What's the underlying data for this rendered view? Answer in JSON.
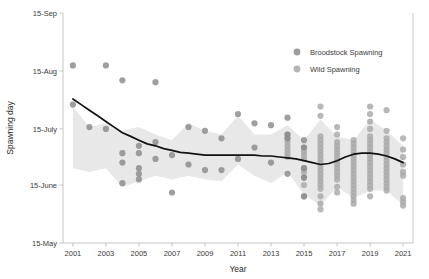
{
  "chart_data": {
    "type": "scatter",
    "title": "",
    "xlabel": "Year",
    "ylabel": "Spawning day",
    "xlim": [
      2000.4,
      2021.6
    ],
    "ylim": [
      0,
      123
    ],
    "grid": false,
    "legend_position": "top-right",
    "x_ticks": [
      2001,
      2003,
      2005,
      2007,
      2009,
      2011,
      2013,
      2015,
      2017,
      2019,
      2021
    ],
    "x_tick_labels": [
      "2001",
      "2003",
      "2005",
      "2007",
      "2009",
      "2011",
      "2013",
      "2015",
      "2017",
      "2019",
      "2021"
    ],
    "y_ticks": [
      0,
      31,
      61,
      92,
      123
    ],
    "y_tick_labels": [
      "15-May",
      "15-June",
      "15-July",
      "15-Aug",
      "15-Sep"
    ],
    "colors": {
      "broodstock": "#8a8a8a",
      "wild": "#a8a8a8",
      "trend_line": "#111111",
      "confidence_band": "#e8e8e8",
      "axis": "#b8b8b8",
      "text": "#3a3a3a"
    },
    "legend": [
      {
        "key": "broodstock",
        "label": "Broodstock Spawning",
        "color": "#8a8a8a"
      },
      {
        "key": "wild",
        "label": "Wild Spawning",
        "color": "#a8a8a8"
      }
    ],
    "series": [
      {
        "name": "Broodstock Spawning",
        "key": "broodstock",
        "points": [
          [
            2001,
            95
          ],
          [
            2001,
            74
          ],
          [
            2002,
            62
          ],
          [
            2003,
            95
          ],
          [
            2003,
            61
          ],
          [
            2004,
            87
          ],
          [
            2004,
            48
          ],
          [
            2004,
            43
          ],
          [
            2004,
            32
          ],
          [
            2005,
            52
          ],
          [
            2005,
            48
          ],
          [
            2005,
            40
          ],
          [
            2005,
            37
          ],
          [
            2005,
            34
          ],
          [
            2006,
            86
          ],
          [
            2006,
            54
          ],
          [
            2006,
            45
          ],
          [
            2007,
            47
          ],
          [
            2007,
            27
          ],
          [
            2008,
            62
          ],
          [
            2008,
            42
          ],
          [
            2009,
            60
          ],
          [
            2009,
            39
          ],
          [
            2010,
            56
          ],
          [
            2010,
            39
          ],
          [
            2011,
            69
          ],
          [
            2011,
            45
          ],
          [
            2012,
            64
          ],
          [
            2012,
            51
          ],
          [
            2013,
            63
          ],
          [
            2013,
            43
          ],
          [
            2014,
            67
          ],
          [
            2014,
            58
          ],
          [
            2014,
            56
          ],
          [
            2014,
            37
          ],
          [
            2015,
            55
          ],
          [
            2015,
            51
          ],
          [
            2015,
            40
          ],
          [
            2015,
            35
          ],
          [
            2015,
            25
          ]
        ]
      },
      {
        "name": "Wild Spawning",
        "key": "wild",
        "points": [
          [
            2014,
            58
          ],
          [
            2014,
            56
          ],
          [
            2014,
            54
          ],
          [
            2014,
            52
          ],
          [
            2014,
            50
          ],
          [
            2014,
            48
          ],
          [
            2014,
            46
          ],
          [
            2015,
            51
          ],
          [
            2015,
            49
          ],
          [
            2015,
            47
          ],
          [
            2015,
            45
          ],
          [
            2015,
            40
          ],
          [
            2015,
            38
          ],
          [
            2015,
            35
          ],
          [
            2015,
            31
          ],
          [
            2015,
            25
          ],
          [
            2016,
            73
          ],
          [
            2016,
            68
          ],
          [
            2016,
            57
          ],
          [
            2016,
            55
          ],
          [
            2016,
            53
          ],
          [
            2016,
            51
          ],
          [
            2016,
            49
          ],
          [
            2016,
            47
          ],
          [
            2016,
            45
          ],
          [
            2016,
            43
          ],
          [
            2016,
            41
          ],
          [
            2016,
            39
          ],
          [
            2016,
            37
          ],
          [
            2016,
            35
          ],
          [
            2016,
            33
          ],
          [
            2016,
            31
          ],
          [
            2016,
            29
          ],
          [
            2016,
            25
          ],
          [
            2016,
            21
          ],
          [
            2016,
            18
          ],
          [
            2017,
            62
          ],
          [
            2017,
            58
          ],
          [
            2017,
            54
          ],
          [
            2017,
            52
          ],
          [
            2017,
            50
          ],
          [
            2017,
            48
          ],
          [
            2017,
            46
          ],
          [
            2017,
            44
          ],
          [
            2017,
            42
          ],
          [
            2017,
            40
          ],
          [
            2017,
            38
          ],
          [
            2017,
            36
          ],
          [
            2017,
            34
          ],
          [
            2017,
            30
          ],
          [
            2017,
            27
          ],
          [
            2018,
            55
          ],
          [
            2018,
            53
          ],
          [
            2018,
            51
          ],
          [
            2018,
            49
          ],
          [
            2018,
            47
          ],
          [
            2018,
            45
          ],
          [
            2018,
            43
          ],
          [
            2018,
            41
          ],
          [
            2018,
            39
          ],
          [
            2018,
            37
          ],
          [
            2018,
            35
          ],
          [
            2018,
            33
          ],
          [
            2018,
            31
          ],
          [
            2018,
            29
          ],
          [
            2018,
            27
          ],
          [
            2018,
            25
          ],
          [
            2018,
            23
          ],
          [
            2018,
            21
          ],
          [
            2019,
            73
          ],
          [
            2019,
            69
          ],
          [
            2019,
            65
          ],
          [
            2019,
            61
          ],
          [
            2019,
            57
          ],
          [
            2019,
            55
          ],
          [
            2019,
            53
          ],
          [
            2019,
            51
          ],
          [
            2019,
            49
          ],
          [
            2019,
            47
          ],
          [
            2019,
            45
          ],
          [
            2019,
            43
          ],
          [
            2019,
            41
          ],
          [
            2019,
            39
          ],
          [
            2019,
            37
          ],
          [
            2019,
            35
          ],
          [
            2019,
            33
          ],
          [
            2019,
            31
          ],
          [
            2019,
            29
          ],
          [
            2019,
            25
          ],
          [
            2020,
            71
          ],
          [
            2020,
            60
          ],
          [
            2020,
            56
          ],
          [
            2020,
            54
          ],
          [
            2020,
            52
          ],
          [
            2020,
            50
          ],
          [
            2020,
            48
          ],
          [
            2020,
            46
          ],
          [
            2020,
            44
          ],
          [
            2020,
            42
          ],
          [
            2020,
            40
          ],
          [
            2020,
            38
          ],
          [
            2020,
            36
          ],
          [
            2020,
            34
          ],
          [
            2020,
            32
          ],
          [
            2020,
            30
          ],
          [
            2020,
            28
          ],
          [
            2021,
            56
          ],
          [
            2021,
            50
          ],
          [
            2021,
            46
          ],
          [
            2021,
            42
          ],
          [
            2021,
            38
          ],
          [
            2021,
            36
          ],
          [
            2021,
            24
          ],
          [
            2021,
            22
          ],
          [
            2021,
            20
          ]
        ]
      }
    ],
    "trend_line": {
      "name": "Smoothed trend",
      "points": [
        [
          2001.0,
          77
        ],
        [
          2001.5,
          74
        ],
        [
          2002.0,
          71
        ],
        [
          2002.5,
          68
        ],
        [
          2003.0,
          65
        ],
        [
          2003.5,
          62
        ],
        [
          2004.0,
          59
        ],
        [
          2004.5,
          57
        ],
        [
          2005.0,
          55
        ],
        [
          2005.5,
          53
        ],
        [
          2006.0,
          52
        ],
        [
          2006.5,
          50.5
        ],
        [
          2007.0,
          49.5
        ],
        [
          2007.5,
          48.5
        ],
        [
          2008.0,
          48
        ],
        [
          2008.5,
          47.5
        ],
        [
          2009.0,
          47
        ],
        [
          2009.5,
          47
        ],
        [
          2010.0,
          47
        ],
        [
          2010.5,
          47
        ],
        [
          2011.0,
          47
        ],
        [
          2011.5,
          47
        ],
        [
          2012.0,
          47
        ],
        [
          2012.5,
          46.5
        ],
        [
          2013.0,
          46.5
        ],
        [
          2013.5,
          46
        ],
        [
          2014.0,
          45.5
        ],
        [
          2014.5,
          45
        ],
        [
          2015.0,
          44
        ],
        [
          2015.5,
          43
        ],
        [
          2016.0,
          42
        ],
        [
          2016.5,
          42.5
        ],
        [
          2017.0,
          44
        ],
        [
          2017.5,
          46
        ],
        [
          2018.0,
          47.5
        ],
        [
          2018.5,
          48
        ],
        [
          2019.0,
          48
        ],
        [
          2019.5,
          47.5
        ],
        [
          2020.0,
          46.5
        ],
        [
          2020.5,
          45
        ],
        [
          2021.0,
          43
        ]
      ]
    },
    "confidence_band": {
      "upper": [
        [
          2001.0,
          73
        ],
        [
          2002.0,
          62
        ],
        [
          2003.0,
          64
        ],
        [
          2004.0,
          60
        ],
        [
          2005.0,
          62
        ],
        [
          2006.0,
          58
        ],
        [
          2007.0,
          55
        ],
        [
          2008.0,
          64
        ],
        [
          2009.0,
          60
        ],
        [
          2010.0,
          58
        ],
        [
          2011.0,
          68
        ],
        [
          2012.0,
          58
        ],
        [
          2013.0,
          58
        ],
        [
          2014.0,
          63
        ],
        [
          2015.0,
          55
        ],
        [
          2016.0,
          66
        ],
        [
          2017.0,
          57
        ],
        [
          2018.0,
          55
        ],
        [
          2019.0,
          66
        ],
        [
          2020.0,
          60
        ],
        [
          2021.0,
          52
        ]
      ],
      "lower": [
        [
          2001.0,
          40
        ],
        [
          2002.0,
          38
        ],
        [
          2003.0,
          40
        ],
        [
          2004.0,
          30
        ],
        [
          2005.0,
          33
        ],
        [
          2006.0,
          36
        ],
        [
          2007.0,
          34
        ],
        [
          2008.0,
          36
        ],
        [
          2009.0,
          34
        ],
        [
          2010.0,
          33
        ],
        [
          2011.0,
          42
        ],
        [
          2012.0,
          36
        ],
        [
          2013.0,
          32
        ],
        [
          2014.0,
          38
        ],
        [
          2015.0,
          26
        ],
        [
          2016.0,
          20
        ],
        [
          2017.0,
          30
        ],
        [
          2018.0,
          24
        ],
        [
          2019.0,
          28
        ],
        [
          2020.0,
          28
        ],
        [
          2021.0,
          20
        ]
      ]
    }
  },
  "axes": {
    "x_title": "Year",
    "y_title": "Spawning day"
  }
}
